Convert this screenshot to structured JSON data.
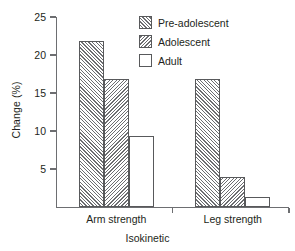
{
  "chart_data": {
    "type": "bar",
    "title": "",
    "xlabel": "Isokinetic",
    "ylabel": "Change (%)",
    "categories": [
      "Arm strength",
      "Leg strength"
    ],
    "series": [
      {
        "name": "Pre-adolescent",
        "pattern": "forward-hatch",
        "values": [
          21.9,
          16.9
        ]
      },
      {
        "name": "Adolescent",
        "pattern": "backward-hatch",
        "values": [
          16.9,
          4.0
        ]
      },
      {
        "name": "Adult",
        "pattern": "empty",
        "values": [
          9.4,
          1.3
        ]
      }
    ],
    "ylim": [
      0,
      25
    ],
    "yticks": [
      5,
      10,
      15,
      20,
      25
    ],
    "ytick_labels": [
      "5",
      "10",
      "15",
      "20",
      "25"
    ],
    "grid": false,
    "legend_position": "top-right",
    "colors": {
      "axis": "#6d6e71",
      "bar_outline": "#58595b",
      "hatch": "#6d6e71",
      "text": "#231f20",
      "background": "#ffffff"
    }
  },
  "legend": {
    "entries": [
      {
        "label": "Pre-adolescent"
      },
      {
        "label": "Adolescent"
      },
      {
        "label": "Adult"
      }
    ]
  }
}
